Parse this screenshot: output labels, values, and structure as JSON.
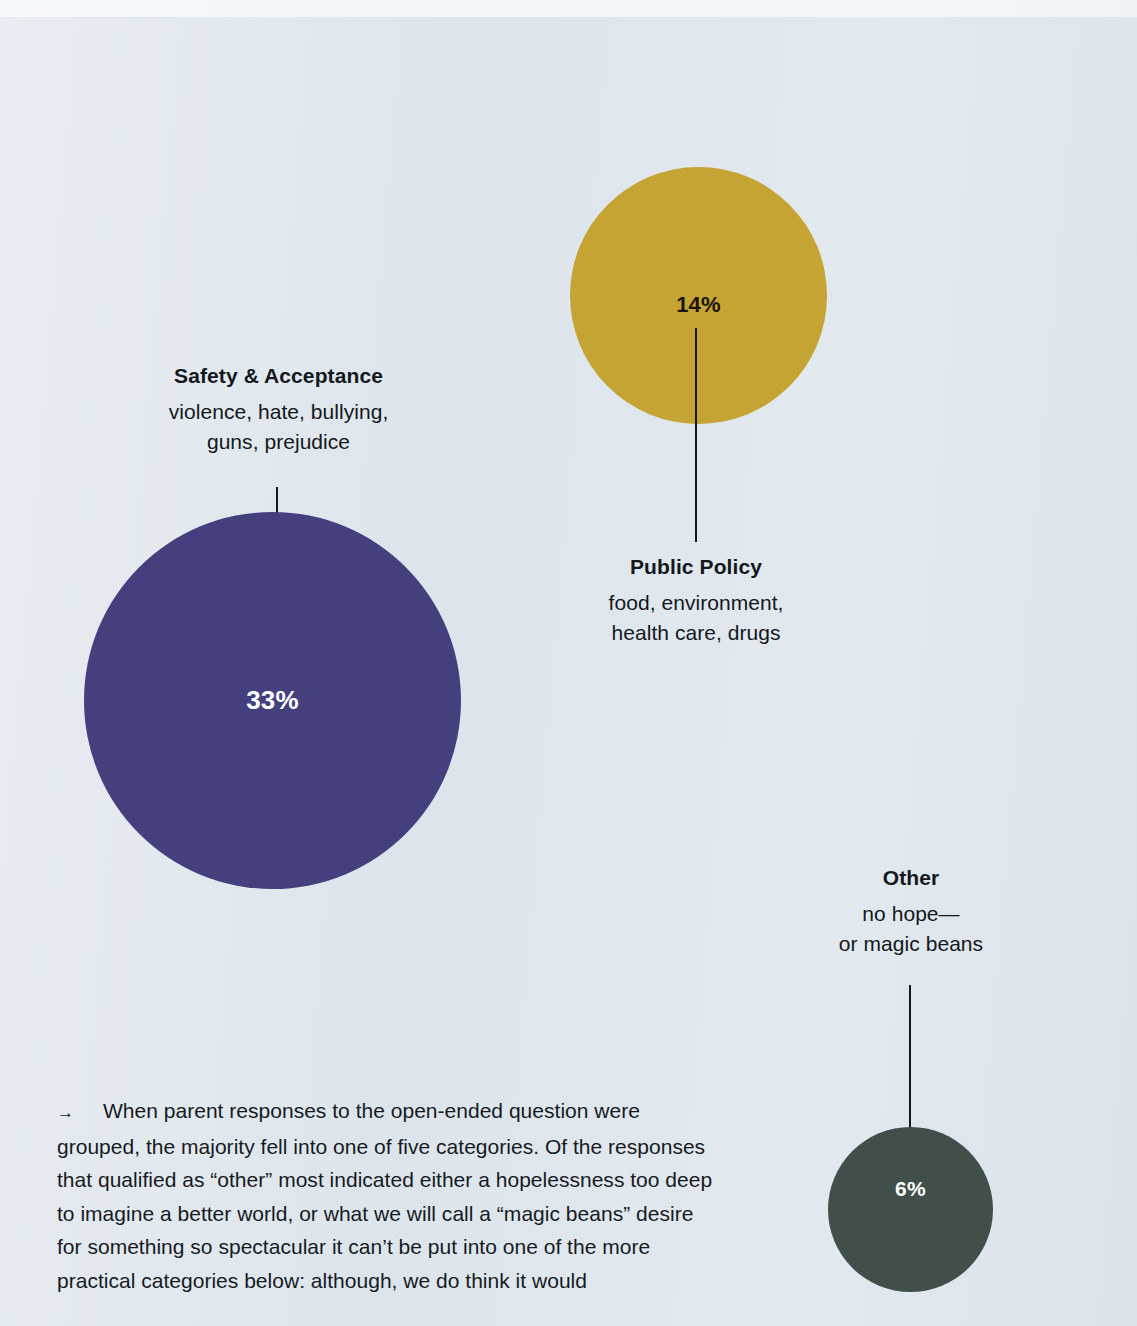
{
  "page": {
    "background_color": "#dde5ec",
    "text_color": "#14181c"
  },
  "chart_data": {
    "type": "bubble",
    "title": "",
    "subtitle": "",
    "xlabel": "",
    "ylabel": "",
    "legend_position": "inline-labels",
    "grid": false,
    "units": "percent",
    "note": "Proportional-area bubbles showing share of parent responses by category. Labels sit outside each bubble and connect with a thin leader line.",
    "categories": [
      "Safety & Acceptance",
      "Public Policy",
      "Other"
    ],
    "values": [
      33,
      14,
      6
    ],
    "value_labels": [
      "33%",
      "14%",
      "6%"
    ],
    "colors": [
      "#443f7d",
      "#c5a433",
      "#414f4a"
    ],
    "descriptions": [
      "violence, hate, bullying, guns, prejudice",
      "food, environment, health care, drugs",
      "no hope— or magic beans"
    ],
    "series": [
      {
        "name": "Share of parent responses",
        "points": [
          {
            "label": "Safety & Acceptance",
            "value": 33,
            "value_label": "33%",
            "color": "#443f7d",
            "description_lines": [
              "violence, hate, bullying,",
              "guns, prejudice"
            ]
          },
          {
            "label": "Public Policy",
            "value": 14,
            "value_label": "14%",
            "color": "#c5a433",
            "description_lines": [
              "food, environment,",
              "health care, drugs"
            ]
          },
          {
            "label": "Other",
            "value": 6,
            "value_label": "6%",
            "color": "#414f4a",
            "description_lines": [
              "no hope—",
              "or magic beans"
            ]
          }
        ]
      }
    ]
  },
  "bubbles": {
    "safety": {
      "title": "Safety & Acceptance",
      "desc_line_1": "violence, hate, bullying,",
      "desc_line_2": "guns, prejudice",
      "value": "33%",
      "color": "#443f7d"
    },
    "policy": {
      "title": "Public Policy",
      "desc_line_1": "food, environment,",
      "desc_line_2": "health care, drugs",
      "value": "14%",
      "color": "#c5a433"
    },
    "other": {
      "title": "Other",
      "desc_line_1": "no hope—",
      "desc_line_2": "or magic beans",
      "value": "6%",
      "color": "#414f4a"
    }
  },
  "body": {
    "arrow": "→",
    "paragraph": "When parent responses to the open-ended question were grouped, the majority fell into one of five categories. Of the responses that qualified as “other” most indicated either a hopelessness too deep to imagine a better world, or what we will call a “magic beans” desire for something so spectacular it can’t be put into one of the more practical categories below: although, we do think it would"
  }
}
